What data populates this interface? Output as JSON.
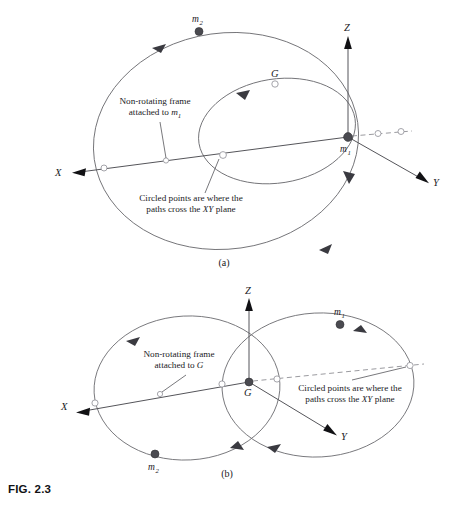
{
  "figure": {
    "caption_id": "FIG. 2.3",
    "panels": [
      {
        "id": "a",
        "label": "(a)",
        "frame_note_line1": "Non-rotating frame",
        "frame_note_line2_prefix": "attached to ",
        "frame_note_line2_symbol": "m",
        "frame_note_line2_sub": "1",
        "crossing_note_line1": "Circled points are where the",
        "crossing_note_line2_prefix": "paths cross the ",
        "crossing_note_line2_italic": "XY",
        "crossing_note_line2_suffix": " plane",
        "axes": [
          {
            "name": "X",
            "label": "X"
          },
          {
            "name": "Y",
            "label": "Y"
          },
          {
            "name": "Z",
            "label": "Z"
          }
        ],
        "points": [
          {
            "name": "m2",
            "label": "m",
            "sub": "2",
            "kind": "filled"
          },
          {
            "name": "m1",
            "label": "m",
            "sub": "1",
            "kind": "filled"
          },
          {
            "name": "G",
            "label": "G",
            "sub": "",
            "kind": "open"
          }
        ],
        "origin_label": "m",
        "origin_sub": "1"
      },
      {
        "id": "b",
        "label": "(b)",
        "frame_note_line1": "Non-rotating frame",
        "frame_note_line2_prefix": "attached to ",
        "frame_note_line2_symbol": "G",
        "frame_note_line2_sub": "",
        "crossing_note_line1": "Circled points are where the",
        "crossing_note_line2_prefix": "paths cross the ",
        "crossing_note_line2_italic": "XY",
        "crossing_note_line2_suffix": " plane",
        "axes": [
          {
            "name": "X",
            "label": "X"
          },
          {
            "name": "Y",
            "label": "Y"
          },
          {
            "name": "Z",
            "label": "Z"
          }
        ],
        "points": [
          {
            "name": "m1",
            "label": "m",
            "sub": "1",
            "kind": "filled"
          },
          {
            "name": "m2",
            "label": "m",
            "sub": "2",
            "kind": "filled"
          },
          {
            "name": "G",
            "label": "G",
            "sub": "",
            "kind": "filled"
          }
        ],
        "origin_label": "G",
        "origin_sub": ""
      }
    ],
    "colors": {
      "orbit_stroke": "#6e6e72",
      "axis_stroke": "#55555a",
      "dashed_stroke": "#8e8e94",
      "body_fill": "#4a4a50",
      "text": "#1a1a1e",
      "background": "#ffffff"
    }
  }
}
